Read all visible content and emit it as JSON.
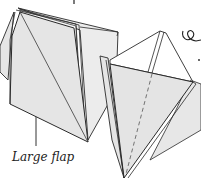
{
  "diagram": {
    "type": "origami-instruction",
    "labels": {
      "large_flap": "Large flap"
    },
    "colors": {
      "paper_face": "#e5e5e5",
      "paper_inner": "#ffffff",
      "outline": "#2a2a2a",
      "crease_dashed": "#555555"
    },
    "symbols": [
      {
        "name": "loop-arrow-icon",
        "description": "curl/rotate symbol, top right"
      }
    ]
  }
}
